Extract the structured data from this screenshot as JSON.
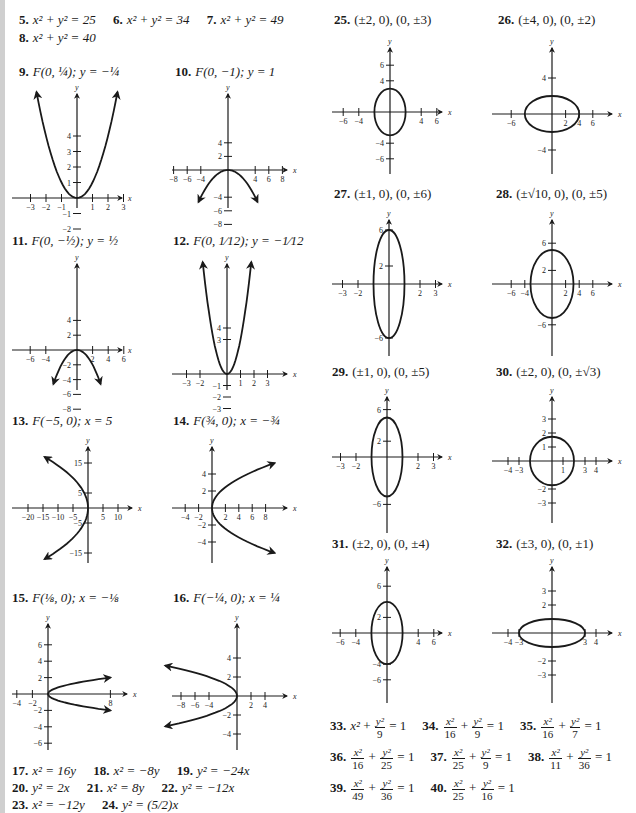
{
  "page": {
    "answers_top": [
      {
        "num": "5.",
        "text": "x² + y² = 25"
      },
      {
        "num": "6.",
        "text": "x² + y² = 34"
      },
      {
        "num": "7.",
        "text": "x² + y² = 49"
      },
      {
        "num": "8.",
        "text": "x² + y² = 40"
      }
    ],
    "graph_labels": {
      "g9": {
        "num": "9.",
        "text": "F(0, ¼); y = −¼"
      },
      "g10": {
        "num": "10.",
        "text": "F(0, −1); y = 1"
      },
      "g11": {
        "num": "11.",
        "text": "F(0, −½); y = ½"
      },
      "g12": {
        "num": "12.",
        "text": "F(0, 1⁄12); y = −1⁄12"
      },
      "g13": {
        "num": "13.",
        "text": "F(−5, 0); x = 5"
      },
      "g14": {
        "num": "14.",
        "text": "F(¾, 0); x = −¾"
      },
      "g15": {
        "num": "15.",
        "text": "F(⅛, 0); x = −⅛"
      },
      "g16": {
        "num": "16.",
        "text": "F(−¼, 0); x = ¼"
      },
      "g25": {
        "num": "25.",
        "text": "(±2, 0), (0, ±3)"
      },
      "g26": {
        "num": "26.",
        "text": "(±4, 0), (0, ±2)"
      },
      "g27": {
        "num": "27.",
        "text": "(±1, 0), (0, ±6)"
      },
      "g28": {
        "num": "28.",
        "text": "(±√10, 0), (0, ±5)"
      },
      "g29": {
        "num": "29.",
        "text": "(±1, 0), (0, ±5)"
      },
      "g30": {
        "num": "30.",
        "text": "(±2, 0), (0, ±√3)"
      },
      "g31": {
        "num": "31.",
        "text": "(±2, 0), (0, ±4)"
      },
      "g32": {
        "num": "32.",
        "text": "(±3, 0), (0, ±1)"
      }
    },
    "answers_17_24": [
      [
        {
          "num": "17.",
          "text": "x² = 16y"
        },
        {
          "num": "18.",
          "text": "x² = −8y"
        },
        {
          "num": "19.",
          "text": "y² = −24x"
        }
      ],
      [
        {
          "num": "20.",
          "text": "y² = 2x"
        },
        {
          "num": "21.",
          "text": "x² = 8y"
        },
        {
          "num": "22.",
          "text": "y² = −12x"
        }
      ],
      [
        {
          "num": "23.",
          "text": "x² = −12y"
        },
        {
          "num": "24.",
          "text": "y² = (5/2)x"
        }
      ]
    ],
    "answers_33_40": [
      [
        {
          "num": "33.",
          "xden": "",
          "yden": "9",
          "rhs": "= 1",
          "xplain": "x²"
        },
        {
          "num": "34.",
          "xden": "16",
          "yden": "9",
          "rhs": "= 1"
        },
        {
          "num": "35.",
          "xden": "16",
          "yden": "7",
          "rhs": "= 1"
        }
      ],
      [
        {
          "num": "36.",
          "xden": "16",
          "yden": "25",
          "rhs": "= 1"
        },
        {
          "num": "37.",
          "xden": "25",
          "yden": "9",
          "rhs": "= 1"
        },
        {
          "num": "38.",
          "xden": "11",
          "yden": "36",
          "rhs": "= 1"
        }
      ],
      [
        {
          "num": "39.",
          "xden": "49",
          "yden": "36",
          "rhs": "= 1"
        },
        {
          "num": "40.",
          "xden": "25",
          "yden": "16",
          "rhs": "= 1"
        }
      ]
    ],
    "frac_num_x": "x²",
    "frac_num_y": "y²",
    "plus": "+"
  },
  "chart_data": [
    {
      "id": "g9",
      "type": "line",
      "curve": "parabola",
      "equation": "x^2 = y",
      "opens": "up",
      "vertex": [
        0,
        0
      ],
      "xticks": [
        -3,
        -2,
        -1,
        1,
        2,
        3
      ],
      "yticks": [
        -2,
        -1,
        1,
        2,
        3,
        4
      ],
      "xlabel": "x",
      "ylabel": "y"
    },
    {
      "id": "g10",
      "type": "line",
      "curve": "parabola",
      "equation": "x^2 = -4y",
      "opens": "down",
      "vertex": [
        0,
        0
      ],
      "xticks": [
        -8,
        -6,
        -4,
        4,
        6,
        8
      ],
      "yticks": [
        -8,
        -6,
        -4,
        2,
        4
      ],
      "xlabel": "x",
      "ylabel": "y"
    },
    {
      "id": "g11",
      "type": "line",
      "curve": "parabola",
      "equation": "x^2 = -2y",
      "opens": "down",
      "vertex": [
        0,
        0
      ],
      "xticks": [
        -6,
        -4,
        2,
        4,
        6
      ],
      "yticks": [
        -8,
        -6,
        -4,
        -2,
        2,
        4
      ],
      "xlabel": "x",
      "ylabel": "y"
    },
    {
      "id": "g12",
      "type": "line",
      "curve": "parabola",
      "equation": "x^2 = y/3",
      "opens": "up",
      "vertex": [
        0,
        0
      ],
      "xticks": [
        -3,
        -2,
        1,
        2,
        3
      ],
      "yticks": [
        -3,
        -2,
        -1,
        3,
        4
      ],
      "xlabel": "x",
      "ylabel": "y"
    },
    {
      "id": "g13",
      "type": "line",
      "curve": "parabola",
      "equation": "y^2 = -20x",
      "opens": "left",
      "vertex": [
        0,
        0
      ],
      "xticks": [
        -20,
        -15,
        -10,
        -5,
        5,
        10
      ],
      "yticks": [
        -15,
        -5,
        5,
        15
      ],
      "xlabel": "x",
      "ylabel": "y"
    },
    {
      "id": "g14",
      "type": "line",
      "curve": "parabola",
      "equation": "y^2 = 3x",
      "opens": "right",
      "vertex": [
        0,
        0
      ],
      "xticks": [
        -4,
        -2,
        2,
        4,
        6,
        8
      ],
      "yticks": [
        -4,
        -2,
        2,
        4
      ],
      "xlabel": "x",
      "ylabel": "y"
    },
    {
      "id": "g15",
      "type": "line",
      "curve": "parabola",
      "equation": "y^2 = x/2",
      "opens": "right",
      "vertex": [
        0,
        0
      ],
      "xticks": [
        -4,
        -2,
        8
      ],
      "yticks": [
        -6,
        -4,
        -2,
        2,
        4,
        6
      ],
      "xlabel": "x",
      "ylabel": "y"
    },
    {
      "id": "g16",
      "type": "line",
      "curve": "parabola",
      "equation": "y^2 = -x",
      "opens": "left",
      "vertex": [
        0,
        0
      ],
      "xticks": [
        -8,
        -6,
        -4,
        2,
        4
      ],
      "yticks": [
        -4,
        -2,
        2,
        4
      ],
      "xlabel": "x",
      "ylabel": "y"
    },
    {
      "id": "g25",
      "type": "line",
      "curve": "ellipse",
      "a": 2,
      "b": 3,
      "xticks": [
        -6,
        -4,
        4,
        6
      ],
      "yticks": [
        -6,
        -4,
        4,
        6
      ],
      "xlabel": "x",
      "ylabel": "y"
    },
    {
      "id": "g26",
      "type": "line",
      "curve": "ellipse",
      "a": 4,
      "b": 2,
      "xticks": [
        -6,
        2,
        4,
        6
      ],
      "yticks": [
        -4,
        4
      ],
      "xlabel": "x",
      "ylabel": "y"
    },
    {
      "id": "g27",
      "type": "line",
      "curve": "ellipse",
      "a": 1,
      "b": 6,
      "xticks": [
        -3,
        -2,
        2,
        3
      ],
      "yticks": [
        -6,
        2,
        6
      ],
      "xlabel": "x",
      "ylabel": "y"
    },
    {
      "id": "g28",
      "type": "line",
      "curve": "ellipse",
      "a": 3.162,
      "b": 5,
      "xticks": [
        -6,
        -4,
        2,
        4,
        6
      ],
      "yticks": [
        -6,
        2,
        6
      ],
      "xlabel": "x",
      "ylabel": "y"
    },
    {
      "id": "g29",
      "type": "line",
      "curve": "ellipse",
      "a": 1,
      "b": 5,
      "xticks": [
        -3,
        -2,
        2,
        3
      ],
      "yticks": [
        -6,
        2,
        6
      ],
      "xlabel": "x",
      "ylabel": "y"
    },
    {
      "id": "g30",
      "type": "line",
      "curve": "ellipse",
      "a": 2,
      "b": 1.732,
      "xticks": [
        -4,
        -3,
        1,
        3,
        4
      ],
      "yticks": [
        -3,
        -2,
        1,
        2,
        3
      ],
      "xlabel": "x",
      "ylabel": "y"
    },
    {
      "id": "g31",
      "type": "line",
      "curve": "ellipse",
      "a": 2,
      "b": 4,
      "xticks": [
        -6,
        -4,
        4,
        6
      ],
      "yticks": [
        -6,
        -4,
        2,
        6
      ],
      "xlabel": "x",
      "ylabel": "y"
    },
    {
      "id": "g32",
      "type": "line",
      "curve": "ellipse",
      "a": 3,
      "b": 1,
      "xticks": [
        -4,
        -3,
        3,
        4
      ],
      "yticks": [
        -3,
        -2,
        2,
        3
      ],
      "xlabel": "x",
      "ylabel": "y"
    }
  ]
}
